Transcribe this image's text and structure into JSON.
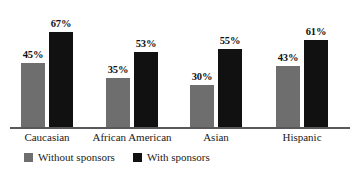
{
  "chart_data": {
    "type": "bar",
    "title": "",
    "subtitle": "",
    "xlabel": "",
    "ylabel": "",
    "ylim": [
      0,
      75
    ],
    "grid": false,
    "legend_position": "bottom",
    "categories": [
      "Caucasian",
      "African American",
      "Asian",
      "Hispanic"
    ],
    "series": [
      {
        "name": "Without sponsors",
        "color": "#6e6e6e",
        "values": [
          45,
          35,
          30,
          43
        ],
        "labels": [
          "45%",
          "35%",
          "30%",
          "43%"
        ]
      },
      {
        "name": "With sponsors",
        "color": "#111111",
        "values": [
          67,
          53,
          55,
          61
        ],
        "labels": [
          "67%",
          "53%",
          "55%",
          "61%"
        ]
      }
    ],
    "value_suffix": "%"
  },
  "axis": {
    "baseline_color": "#58585a"
  },
  "legend": {
    "items": [
      {
        "label": "Without sponsors",
        "color": "#6e6e6e"
      },
      {
        "label": "With sponsors",
        "color": "#111111"
      }
    ]
  }
}
